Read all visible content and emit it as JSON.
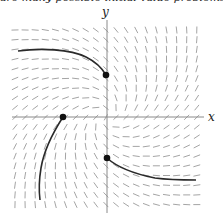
{
  "caption": "are many possible initial value problems, ...",
  "chart_data": {
    "type": "slope_field",
    "title": "",
    "xlabel": "x",
    "ylabel": "y",
    "equation": "dy/dx = (x + y) / (x - y)",
    "grid": false,
    "legend": "none",
    "pixel_origin": [
      107,
      117
    ],
    "field_extent_px": {
      "x_min": 15,
      "x_max": 197,
      "y_min": 30,
      "y_max": 205
    },
    "grid_spacing_px": {
      "dx": 10.1,
      "dy": 9.7
    },
    "units_per_px": 0.04,
    "segment_length_px": 7,
    "colors": {
      "axes": "#8a8a8a",
      "segments": "#9a9a9a",
      "solutions": "#2a2a2a",
      "points": "#111111"
    },
    "initial_points": [
      {
        "name": "point-upper",
        "px": [
          106,
          75
        ]
      },
      {
        "name": "point-left",
        "px": [
          63,
          117
        ]
      },
      {
        "name": "point-lower",
        "px": [
          107,
          158
        ]
      }
    ],
    "solution_curves": [
      {
        "name": "curve-upper-left",
        "path": "M18,51 C40,48 70,49 86,57 C96,62 102,68 106,75"
      },
      {
        "name": "curve-lower-left",
        "path": "M63,117 C52,134 44,150 41,168 C39,180 39,192 40,200"
      },
      {
        "name": "curve-lower-right",
        "path": "M107,158 C118,168 135,174 155,178 C170,180 185,180 196,180"
      }
    ]
  }
}
